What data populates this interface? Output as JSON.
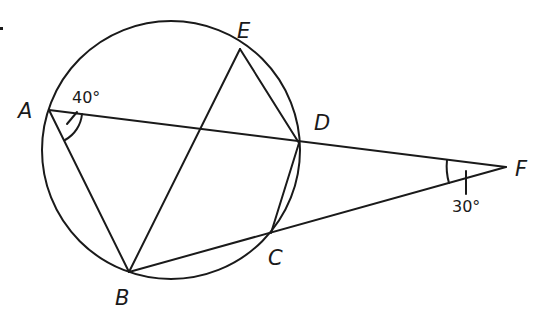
{
  "diagram": {
    "type": "geometry",
    "colors": {
      "stroke": "#1a1a1a",
      "background": "#ffffff"
    },
    "circle": {
      "cx": 171,
      "cy": 150,
      "r": 129
    },
    "points": {
      "A": {
        "label": "A",
        "x": 49,
        "y": 110
      },
      "B": {
        "label": "B",
        "x": 129,
        "y": 272
      },
      "C": {
        "label": "C",
        "x": 271,
        "y": 233
      },
      "D": {
        "label": "D",
        "x": 299,
        "y": 143
      },
      "E": {
        "label": "E",
        "x": 240,
        "y": 49
      },
      "F": {
        "label": "F",
        "x": 506,
        "y": 167
      }
    },
    "segments": [
      "AF",
      "BF",
      "AB",
      "BE",
      "ED",
      "DC"
    ],
    "angles": {
      "A": {
        "label": "40°",
        "vertex": "A",
        "between": [
          "AB",
          "AD"
        ]
      },
      "F": {
        "label": "30°",
        "vertex": "F",
        "between": [
          "FA",
          "FB"
        ]
      }
    }
  }
}
